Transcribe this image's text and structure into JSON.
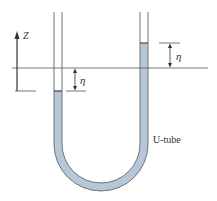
{
  "diagram": {
    "axis_label": "Z",
    "eta_left": "η",
    "eta_right": "η",
    "tube_label": "U-tube",
    "colors": {
      "line": "#555555",
      "fluid": "#b8c7d8",
      "tube_wall": "#6b7480"
    }
  }
}
